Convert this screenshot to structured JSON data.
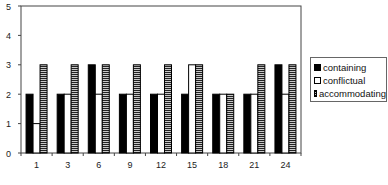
{
  "chart_data": {
    "type": "bar",
    "title": "",
    "xlabel": "",
    "ylabel": "",
    "categories": [
      "1",
      "3",
      "6",
      "9",
      "12",
      "15",
      "18",
      "21",
      "24"
    ],
    "series": [
      {
        "name": "containing",
        "pattern": "solid",
        "color": "#000000",
        "values": [
          2,
          2,
          3,
          2,
          2,
          2,
          2,
          2,
          3
        ]
      },
      {
        "name": "conflictual",
        "pattern": "empty",
        "color": "#ffffff",
        "values": [
          1,
          2,
          2,
          2,
          2,
          3,
          2,
          2,
          2
        ]
      },
      {
        "name": "accommodating",
        "pattern": "horizontal-stripes",
        "color": "#888888",
        "values": [
          3,
          3,
          3,
          3,
          3,
          3,
          2,
          3,
          3
        ]
      }
    ],
    "ylim": [
      0,
      5
    ],
    "yticks": [
      "0",
      "1",
      "2",
      "3",
      "4",
      "5"
    ],
    "grid": false,
    "legend_position": "right"
  },
  "legend": {
    "items": [
      {
        "label": "containing"
      },
      {
        "label": "conflictual"
      },
      {
        "label": "accommodating"
      }
    ]
  }
}
